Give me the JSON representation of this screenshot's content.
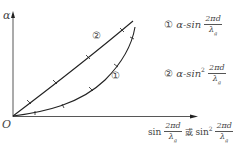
{
  "axes": {
    "y_label": "α",
    "origin_label": "O",
    "x_label": {
      "part1_prefix": "sin",
      "part1_num": "2πd",
      "part1_den": "λ",
      "part1_den_sub": "g",
      "connector": "或",
      "part2_prefix": "sin",
      "part2_sup": "2",
      "part2_num": "2πd",
      "part2_den": "λ",
      "part2_den_sub": "g"
    }
  },
  "curves": [
    {
      "id": "1",
      "marker": "①",
      "label_prefix": "α-sin",
      "sup": "",
      "num": "2πd",
      "den": "λ",
      "den_sub": "g",
      "shape": "convex"
    },
    {
      "id": "2",
      "marker": "②",
      "label_prefix": "α-sin",
      "sup": "2",
      "num": "2πd",
      "den": "λ",
      "den_sub": "g",
      "shape": "near-linear"
    }
  ],
  "colors": {
    "line": "#333333",
    "text": "#444444",
    "background": "#ffffff"
  }
}
